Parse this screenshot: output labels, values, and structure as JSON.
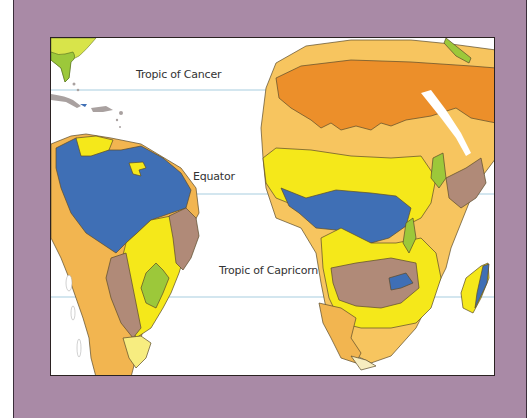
{
  "map": {
    "type": "climate-vegetation-regions",
    "regions_shown": [
      "South America",
      "Africa",
      "Florida",
      "Caribbean",
      "Madagascar",
      "Arabian Peninsula (partial)"
    ],
    "latitude_lines": [
      {
        "name": "tropic_of_cancer",
        "label": "Tropic of Cancer"
      },
      {
        "name": "equator",
        "label": "Equator"
      },
      {
        "name": "tropic_of_capricorn",
        "label": "Tropic of Capricorn"
      }
    ],
    "colors": {
      "frame": "#a98aa6",
      "ocean": "#ffffff",
      "latitude_line": "#a8cde0",
      "rainforest_blue": "#3f6fb5",
      "savanna_yellow": "#f5e81a",
      "desert_dark_orange": "#ec8f2a",
      "semi_desert_orange": "#f2b550",
      "steppe_light_orange": "#f7c55f",
      "highland_brown": "#b08a78",
      "forest_green": "#9cc83a",
      "light_yellow_green": "#d8e44a",
      "pale_cream": "#f7edc0",
      "grey_islands": "#a9a1a0"
    }
  }
}
